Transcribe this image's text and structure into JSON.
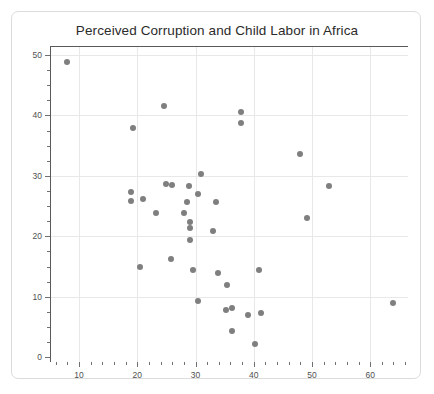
{
  "chart_data": {
    "type": "scatter",
    "title": "Perceived Corruption and Child Labor in Africa",
    "xlabel": "",
    "ylabel": "",
    "xlim": [
      5,
      66.5
    ],
    "ylim": [
      -0.8,
      51.5
    ],
    "grid": true,
    "legend": null,
    "marker_color": "#7f7f7f",
    "xticks": [
      10,
      20,
      30,
      40,
      50,
      60
    ],
    "yticks": [
      0,
      10,
      20,
      30,
      40,
      50
    ],
    "x_minor_step": 2,
    "y_minor_step": 2.5,
    "points": [
      {
        "x": 7.9,
        "y": 48.9
      },
      {
        "x": 19.3,
        "y": 38.0
      },
      {
        "x": 24.6,
        "y": 41.5
      },
      {
        "x": 37.8,
        "y": 40.5
      },
      {
        "x": 37.8,
        "y": 38.7
      },
      {
        "x": 47.9,
        "y": 33.7
      },
      {
        "x": 31.0,
        "y": 30.3
      },
      {
        "x": 25.0,
        "y": 28.6
      },
      {
        "x": 26.0,
        "y": 28.5
      },
      {
        "x": 28.9,
        "y": 28.3
      },
      {
        "x": 52.9,
        "y": 28.3
      },
      {
        "x": 19.0,
        "y": 27.4
      },
      {
        "x": 30.5,
        "y": 27.0
      },
      {
        "x": 18.9,
        "y": 25.9
      },
      {
        "x": 21.0,
        "y": 26.1
      },
      {
        "x": 28.6,
        "y": 25.6
      },
      {
        "x": 33.6,
        "y": 25.6
      },
      {
        "x": 23.2,
        "y": 23.8
      },
      {
        "x": 28.0,
        "y": 23.9
      },
      {
        "x": 49.2,
        "y": 23.0
      },
      {
        "x": 29.0,
        "y": 22.3
      },
      {
        "x": 29.0,
        "y": 21.4
      },
      {
        "x": 33.0,
        "y": 20.9
      },
      {
        "x": 29.0,
        "y": 19.4
      },
      {
        "x": 25.8,
        "y": 16.3
      },
      {
        "x": 20.5,
        "y": 15.0
      },
      {
        "x": 29.5,
        "y": 14.5
      },
      {
        "x": 40.9,
        "y": 14.4
      },
      {
        "x": 33.9,
        "y": 13.9
      },
      {
        "x": 35.4,
        "y": 11.9
      },
      {
        "x": 30.5,
        "y": 9.3
      },
      {
        "x": 35.3,
        "y": 7.8
      },
      {
        "x": 36.3,
        "y": 8.1
      },
      {
        "x": 39.0,
        "y": 7.0
      },
      {
        "x": 41.3,
        "y": 7.3
      },
      {
        "x": 64.0,
        "y": 8.9
      },
      {
        "x": 36.2,
        "y": 4.4
      },
      {
        "x": 40.3,
        "y": 2.1
      }
    ]
  }
}
